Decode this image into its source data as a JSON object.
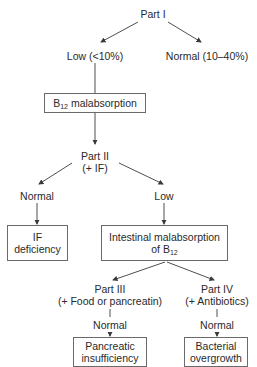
{
  "diagram": {
    "type": "flowchart",
    "nodes": {
      "part1": {
        "label": "Part I"
      },
      "low1": {
        "label": "Low (<10%)"
      },
      "normal1": {
        "label": "Normal (10–40%)"
      },
      "b12_malabsorption": {
        "label_main": "B",
        "label_sub": "12",
        "label_rest": " malabsorption"
      },
      "part2": {
        "line1": "Part II",
        "line2": "(+ IF)"
      },
      "normal2": {
        "label": "Normal"
      },
      "low2": {
        "label": "Low"
      },
      "if_deficiency": {
        "line1": "IF",
        "line2": "deficiency"
      },
      "intestinal": {
        "line1": "Intestinal malabsorption",
        "line2_main": "of B",
        "line2_sub": "12"
      },
      "part3": {
        "line1": "Part III",
        "line2": "(+ Food or pancreatin)"
      },
      "part4": {
        "line1": "Part IV",
        "line2": "(+ Antibiotics)"
      },
      "normal3": {
        "label": "Normal"
      },
      "normal4": {
        "label": "Normal"
      },
      "pancreatic": {
        "line1": "Pancreatic",
        "line2": "insufficiency"
      },
      "bacterial": {
        "line1": "Bacterial",
        "line2": "overgrowth"
      }
    },
    "edges": [
      [
        "part1",
        "low1"
      ],
      [
        "part1",
        "normal1"
      ],
      [
        "low1",
        "b12_malabsorption"
      ],
      [
        "b12_malabsorption",
        "part2"
      ],
      [
        "part2",
        "normal2"
      ],
      [
        "part2",
        "low2"
      ],
      [
        "normal2",
        "if_deficiency"
      ],
      [
        "low2",
        "intestinal"
      ],
      [
        "intestinal",
        "part3"
      ],
      [
        "intestinal",
        "part4"
      ],
      [
        "part3",
        "normal3"
      ],
      [
        "normal3",
        "pancreatic"
      ],
      [
        "part4",
        "normal4"
      ],
      [
        "normal4",
        "bacterial"
      ]
    ],
    "colors": {
      "line": "#3a3a3a",
      "box_border": "#6a6a6a",
      "text": "#2a2a2a"
    }
  }
}
